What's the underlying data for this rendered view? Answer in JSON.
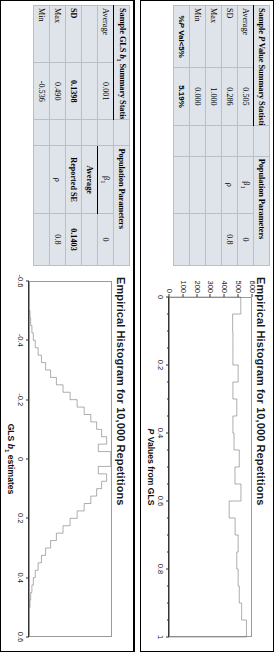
{
  "figure": {
    "orientation": "rotated-90-clockwise",
    "panels": [
      {
        "id": "gls-b1-panel",
        "table": {
          "header_left": "Sample GLS b1 Summary Statistics",
          "header_left_parts": {
            "pre": "Sample GLS ",
            "italic": "b",
            "sub": "1",
            "post": " Summary Statistics"
          },
          "header_right": "Population Parameters",
          "rows": [
            {
              "label": "Average",
              "value": "0.001",
              "param_name": "β1",
              "param_value": "0"
            },
            {
              "label": "",
              "value": "",
              "param_name": "Average",
              "param_value": ""
            },
            {
              "label": "SD",
              "value": "0.1398",
              "param_name": "Reported SE",
              "param_value": "0.1403"
            },
            {
              "label": "Max",
              "value": "0.490",
              "param_name": "ρ",
              "param_value": "0.8"
            },
            {
              "label": "Min",
              "value": "-0.536",
              "param_name": "",
              "param_value": ""
            }
          ]
        },
        "chart": {
          "title": "Empirical Histogram for 10,000 Repetitions",
          "xlabel_pre": "GLS ",
          "xlabel_italic": "b",
          "xlabel_sub": "1",
          "xlabel_post": " estimates"
        }
      },
      {
        "id": "pvalue-panel",
        "table": {
          "header_left": "Sample P Value Summary Statistics",
          "header_left_parts": {
            "pre": "Sample ",
            "italic": "P",
            "post": " Value Summary Statistics"
          },
          "header_right": "Population Parameters",
          "rows": [
            {
              "label": "Average",
              "value": "0.505",
              "param_name": "β1",
              "param_value": "0"
            },
            {
              "label": "SD",
              "value": "0.286",
              "param_name": "ρ",
              "param_value": "0.8"
            },
            {
              "label": "Max",
              "value": "1.000",
              "param_name": "",
              "param_value": ""
            },
            {
              "label": "Min",
              "value": "0.000",
              "param_name": "",
              "param_value": ""
            }
          ],
          "footer_label": "%P Val<5%",
          "footer_label_parts": {
            "pre": "%",
            "italic": "P",
            "post": " Val<5%"
          },
          "footer_value": "5.19%"
        },
        "chart": {
          "title": "Empirical Histogram for 10,000 Repetitions",
          "xlabel_pre": "",
          "xlabel_italic": "P",
          "xlabel_sub": "",
          "xlabel_post": " Values from GLS"
        }
      }
    ]
  },
  "chart_data": [
    {
      "id": "pvalue-histogram",
      "type": "bar",
      "title": "Empirical Histogram for 10,000 Repetitions",
      "xlabel": "P Values from GLS",
      "ylabel": "",
      "xlim": [
        0,
        1
      ],
      "ylim": [
        0,
        600
      ],
      "xticks": [
        0,
        0.2,
        0.4,
        0.6,
        0.8,
        1
      ],
      "xticklabels": [
        "0",
        "0.2",
        "0.4",
        "0.6",
        "0.8",
        "1"
      ],
      "yticks": [
        0,
        100,
        200,
        300,
        400,
        500,
        600
      ],
      "yticklabels": [
        "0",
        "100",
        "200",
        "300",
        "400",
        "500",
        "600"
      ],
      "grid": false,
      "legend": null,
      "bin_edges": [
        0.0,
        0.025,
        0.05,
        0.075,
        0.1,
        0.125,
        0.15,
        0.175,
        0.2,
        0.225,
        0.25,
        0.275,
        0.3,
        0.325,
        0.35,
        0.375,
        0.4,
        0.425,
        0.45,
        0.475,
        0.5,
        0.525,
        0.55,
        0.575,
        0.6,
        0.625,
        0.65,
        0.675,
        0.7,
        0.725,
        0.75,
        0.775,
        0.8,
        0.825,
        0.85,
        0.875,
        0.9,
        0.925,
        0.95,
        0.975,
        1.0
      ],
      "values": [
        519,
        519,
        460,
        460,
        462,
        462,
        462,
        462,
        500,
        500,
        462,
        462,
        490,
        490,
        462,
        462,
        470,
        470,
        508,
        508,
        477,
        477,
        520,
        520,
        435,
        435,
        478,
        478,
        500,
        500,
        490,
        490,
        500,
        500,
        508,
        508,
        525,
        525,
        560,
        560
      ]
    },
    {
      "id": "gls-b1-histogram",
      "type": "bar",
      "title": "Empirical Histogram for 10,000 Repetitions",
      "xlabel": "GLS b1 estimates",
      "ylabel": "",
      "xlim": [
        -0.6,
        0.6
      ],
      "ylim": [
        0,
        1
      ],
      "xticks": [
        -0.6,
        -0.4,
        -0.2,
        0,
        0.2,
        0.4,
        0.6
      ],
      "xticklabels": [
        "-0.6",
        "-0.4",
        "-0.2",
        "0",
        "0.2",
        "0.4",
        "0.6"
      ],
      "yticks": [],
      "yticklabels": [],
      "grid": false,
      "legend": null,
      "bin_edges": [
        -0.5,
        -0.475,
        -0.45,
        -0.425,
        -0.4,
        -0.375,
        -0.35,
        -0.325,
        -0.3,
        -0.275,
        -0.25,
        -0.225,
        -0.2,
        -0.175,
        -0.15,
        -0.125,
        -0.1,
        -0.075,
        -0.05,
        -0.025,
        0.0,
        0.025,
        0.05,
        0.075,
        0.1,
        0.125,
        0.15,
        0.175,
        0.2,
        0.225,
        0.25,
        0.275,
        0.3,
        0.325,
        0.35,
        0.375,
        0.4,
        0.425,
        0.45,
        0.475,
        0.5
      ],
      "values": [
        0.012,
        0.02,
        0.035,
        0.052,
        0.075,
        0.11,
        0.15,
        0.2,
        0.26,
        0.33,
        0.41,
        0.495,
        0.58,
        0.665,
        0.745,
        0.815,
        0.875,
        0.935,
        0.835,
        0.985,
        0.985,
        0.835,
        0.935,
        0.875,
        0.815,
        0.745,
        0.665,
        0.58,
        0.495,
        0.41,
        0.33,
        0.26,
        0.2,
        0.15,
        0.11,
        0.075,
        0.052,
        0.035,
        0.02,
        0.012
      ]
    }
  ]
}
